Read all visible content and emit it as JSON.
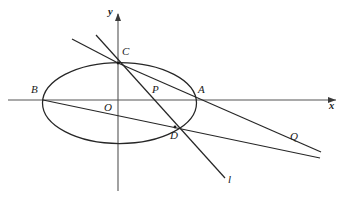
{
  "figure": {
    "stroke_color": "#262626",
    "axis_color": "#555555",
    "background": "#ffffff"
  },
  "axes": {
    "x_axis": {
      "label": "x",
      "label_x": 330,
      "label_y": 103,
      "y": 100,
      "x_start": 8,
      "x_end": 336
    },
    "y_axis": {
      "label": "y",
      "label_x": 108,
      "label_y": 13,
      "x": 118,
      "y_start": 14,
      "y_end": 191
    },
    "origin": {
      "label": "O",
      "label_x": 105,
      "label_y": 102,
      "x": 118,
      "y": 100
    }
  },
  "ellipse": {
    "cx": 119.5,
    "cy": 103,
    "rx": 77,
    "ry": 40.5
  },
  "points": [
    {
      "id": "A",
      "label": "A",
      "x": 196,
      "y": 100,
      "label_x": 198,
      "label_y": 89
    },
    {
      "id": "B",
      "label": "B",
      "x": 43,
      "y": 100,
      "label_x": 31,
      "label_y": 89
    },
    {
      "id": "C",
      "label": "C",
      "x": 118,
      "y": 63,
      "label_x": 122,
      "label_y": 50
    },
    {
      "id": "D",
      "label": "D",
      "x": 175,
      "y": 127,
      "label_x": 170,
      "label_y": 131
    },
    {
      "id": "P",
      "label": "P",
      "x": 160,
      "y": 100,
      "label_x": 152,
      "label_y": 88
    },
    {
      "id": "Q",
      "label": "Q",
      "x": 293,
      "y": 150,
      "label_x": 291,
      "label_y": 135
    }
  ],
  "lines": [
    {
      "id": "line-B-Q",
      "name": "chord-B-through-D-to-Q",
      "x1": 43,
      "y1": 100,
      "x2": 320,
      "y2": 158
    },
    {
      "id": "line-C-Q",
      "name": "chord-C-through-A-to-Q",
      "x1": 118,
      "y1": 63,
      "x2": 321,
      "y2": 152
    },
    {
      "id": "line-C-l",
      "name": "line-l-through-C-and-D",
      "x1": 96,
      "y1": 35,
      "x2": 225,
      "y2": 178
    },
    {
      "id": "ray-C-up",
      "name": "ray-from-C-upper-left",
      "x1": 118,
      "y1": 63,
      "x2": 72,
      "y2": 39
    }
  ],
  "line_labels": [
    {
      "id": "l",
      "label": "l",
      "x": 228,
      "y": 178
    }
  ]
}
